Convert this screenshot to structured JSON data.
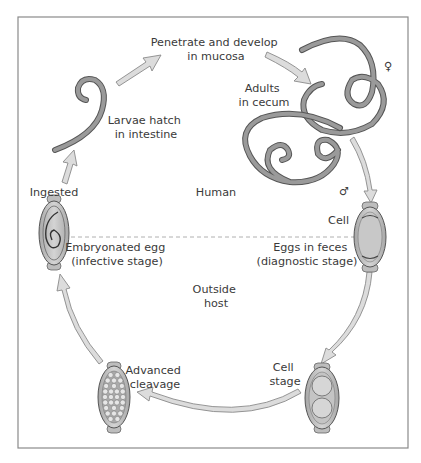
{
  "diagram": {
    "regions": {
      "upper": "Human",
      "lower": [
        "Outside",
        "host"
      ]
    },
    "labels": {
      "penetrate": [
        "Penetrate and develop",
        "in mucosa"
      ],
      "adults": [
        "Adults",
        "in cecum"
      ],
      "larvae": [
        "Larvae hatch",
        "in intestine"
      ],
      "ingested": "Ingested",
      "cell": "Cell",
      "eggs_feces": [
        "Eggs in feces",
        "(diagnostic stage)"
      ],
      "embryonated": [
        "Embryonated egg",
        "(infective stage)"
      ],
      "cell_stage": [
        "Cell",
        "stage"
      ],
      "advanced": [
        "Advanced",
        "cleavage"
      ]
    },
    "symbols": {
      "female": "♀",
      "male": "♂"
    },
    "colors": {
      "arrow_fill": "#dcdcdc",
      "arrow_stroke": "#8a8a8a",
      "worm_fill": "#9a9a9a",
      "worm_stroke": "#555555",
      "egg_fill": "#c8c8c8",
      "frame": "#888888"
    }
  }
}
